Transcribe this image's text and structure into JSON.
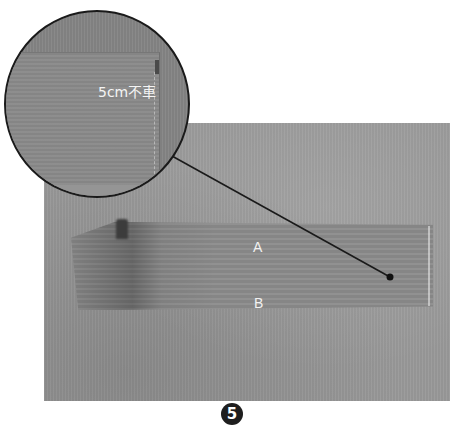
{
  "figure": {
    "step_number": "5",
    "photo": {
      "label_a": "A",
      "label_b": "B"
    },
    "zoom_callout": {
      "label": "5cm不車"
    },
    "colors": {
      "background_photo": "#999999",
      "fabric": "#8d8d8d",
      "callout_border": "#1a1a1a",
      "badge": "#1e1e1e",
      "label_text": "#f2f2f2"
    }
  }
}
